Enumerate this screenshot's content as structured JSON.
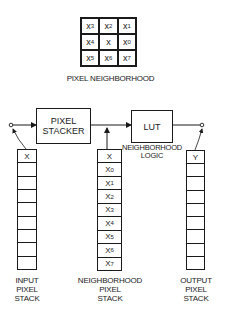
{
  "neighborhood": {
    "title": "PIXEL NEIGHBORHOOD",
    "cells": [
      {
        "base": "x",
        "sub": "3"
      },
      {
        "base": "x",
        "sub": "2"
      },
      {
        "base": "x",
        "sub": "1"
      },
      {
        "base": "x",
        "sub": "4"
      },
      {
        "base": "x",
        "sub": ""
      },
      {
        "base": "x",
        "sub": "0"
      },
      {
        "base": "x",
        "sub": "5"
      },
      {
        "base": "x",
        "sub": "6"
      },
      {
        "base": "x",
        "sub": "7"
      }
    ]
  },
  "blocks": {
    "stacker": {
      "line1": "PIXEL",
      "line2": "STACKER"
    },
    "lut": {
      "label": "LUT"
    },
    "logic_caption": {
      "line1": "NEIGHBORHOOD",
      "line2": "LOGIC"
    }
  },
  "stacks": {
    "input": {
      "top": "X",
      "cells": [
        "X",
        "",
        "",
        "",
        "",
        "",
        "",
        "",
        ""
      ],
      "caption": [
        "INPUT",
        "PIXEL",
        "STACK"
      ]
    },
    "neighborhood": {
      "cells": [
        {
          "base": "X",
          "sub": ""
        },
        {
          "base": "X",
          "sub": "0"
        },
        {
          "base": "X",
          "sub": "1"
        },
        {
          "base": "X",
          "sub": "2"
        },
        {
          "base": "X",
          "sub": "3"
        },
        {
          "base": "X",
          "sub": "4"
        },
        {
          "base": "X",
          "sub": "5"
        },
        {
          "base": "X",
          "sub": "6"
        },
        {
          "base": "X",
          "sub": "7"
        }
      ],
      "caption": [
        "NEIGHBORHOOD",
        "PIXEL",
        "STACK"
      ]
    },
    "output": {
      "cells": [
        "Y",
        "",
        "",
        "",
        "",
        "",
        "",
        "",
        ""
      ],
      "caption": [
        "OUTPUT",
        "PIXEL",
        "STACK"
      ]
    }
  },
  "colors": {
    "line": "#1a1a1a",
    "background": "#ffffff"
  }
}
